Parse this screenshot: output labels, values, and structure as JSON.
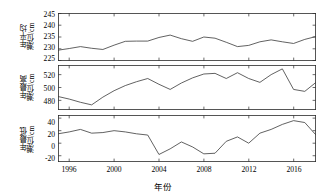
{
  "figure": {
    "xlabel": "年份",
    "background": "#ffffff",
    "line_color": "#3a3a3a",
    "axis_color": "#2b2b2b"
  },
  "xaxis": {
    "ticks": [
      1996,
      2000,
      2004,
      2008,
      2012,
      2016
    ],
    "tick_labels": [
      "1996",
      "2000",
      "2004",
      "2008",
      "2012",
      "2016"
    ],
    "range": [
      1995,
      2018
    ]
  },
  "chart_data": [
    {
      "type": "line",
      "title": "",
      "xlabel": "年份",
      "ylabel": "年平均潮位/cm",
      "ylabel_lines": [
        "年平均",
        "潮位/cm"
      ],
      "ylim": [
        225,
        245
      ],
      "yticks": [
        225,
        230,
        235,
        240,
        245
      ],
      "ytick_labels": [
        "225",
        "230",
        "235",
        "240",
        "245"
      ],
      "grid": false,
      "legend": "none",
      "x": [
        1995,
        1996,
        1997,
        1998,
        1999,
        2000,
        2001,
        2002,
        2003,
        2004,
        2005,
        2006,
        2007,
        2008,
        2009,
        2010,
        2011,
        2012,
        2013,
        2014,
        2015,
        2016,
        2017,
        2018
      ],
      "values": [
        229.5,
        230.2,
        231.0,
        230.3,
        229.8,
        231.6,
        233.2,
        233.3,
        233.3,
        234.8,
        235.8,
        234.3,
        233.2,
        235.0,
        234.5,
        232.8,
        231.0,
        231.5,
        233.0,
        233.8,
        233.0,
        232.3,
        234.0,
        235.2
      ]
    },
    {
      "type": "line",
      "title": "",
      "xlabel": "年份",
      "ylabel": "年最高潮位/cm",
      "ylabel_lines": [
        "年最高",
        "潮位/cm"
      ],
      "ylim": [
        465,
        535
      ],
      "yticks": [
        480,
        500,
        520
      ],
      "ytick_labels": [
        "480",
        "500",
        "520"
      ],
      "grid": false,
      "legend": "none",
      "x": [
        1995,
        1996,
        1997,
        1998,
        1999,
        2000,
        2001,
        2002,
        2003,
        2004,
        2005,
        2006,
        2007,
        2008,
        2009,
        2010,
        2011,
        2012,
        2013,
        2014,
        2015,
        2016,
        2017,
        2018
      ],
      "values": [
        486.0,
        482.0,
        477.0,
        473.0,
        485.0,
        495.0,
        503.0,
        509.0,
        514.0,
        505.0,
        497.0,
        507.0,
        515.0,
        521.0,
        522.0,
        514.0,
        523.0,
        514.0,
        508.0,
        520.0,
        529.0,
        497.0,
        494.0,
        508.0
      ]
    },
    {
      "type": "line",
      "title": "",
      "xlabel": "年份",
      "ylabel": "年最低潮位/cm",
      "ylabel_lines": [
        "年最低",
        "潮位/cm"
      ],
      "ylim": [
        -30,
        45
      ],
      "yticks": [
        -20,
        0,
        20,
        40
      ],
      "ytick_labels": [
        "-20",
        "0",
        "20",
        "40"
      ],
      "grid": false,
      "legend": "none",
      "x": [
        1995,
        1996,
        1997,
        1998,
        1999,
        2000,
        2001,
        2002,
        2003,
        2004,
        2005,
        2006,
        2007,
        2008,
        2009,
        2010,
        2011,
        2012,
        2013,
        2014,
        2015,
        2016,
        2017,
        2018
      ],
      "values": [
        15.0,
        18.0,
        22.0,
        16.0,
        17.0,
        20.0,
        18.0,
        15.0,
        13.0,
        -18.0,
        -9.0,
        2.0,
        -6.0,
        -17.0,
        -16.0,
        3.0,
        10.0,
        0.0,
        16.0,
        22.0,
        30.0,
        36.0,
        33.0,
        13.0
      ]
    }
  ]
}
